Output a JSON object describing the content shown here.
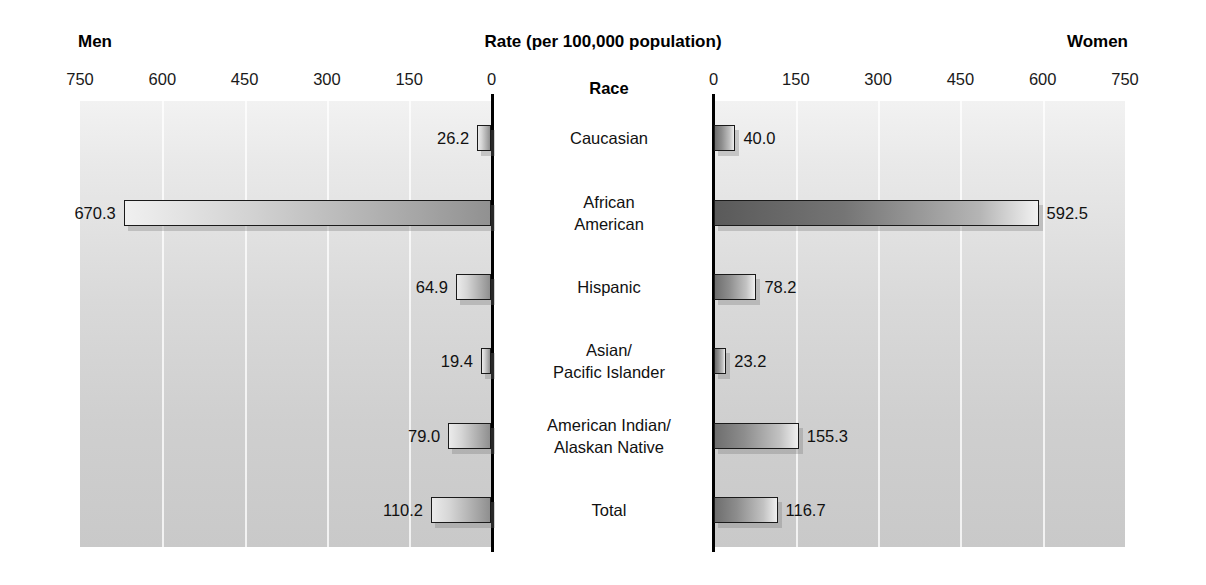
{
  "headers": {
    "men": "Men",
    "rate": "Rate (per 100,000 population)",
    "women": "Women",
    "race": "Race"
  },
  "axis": {
    "left_ticks": [
      "750",
      "600",
      "450",
      "300",
      "150",
      "0"
    ],
    "right_ticks": [
      "0",
      "150",
      "300",
      "450",
      "600",
      "750"
    ],
    "max": 750,
    "min": 0
  },
  "chart_data": {
    "type": "bar",
    "title": "Rate (per 100,000 population)",
    "subtitle": "",
    "orientation": "horizontal",
    "layout": "diverging-population-pyramid",
    "xlabel": "Rate (per 100,000 population)",
    "ylabel": "Race",
    "xlim": [
      0,
      750
    ],
    "grid": true,
    "grid_axis": "x",
    "legend": "none",
    "left_panel_label": "Men",
    "right_panel_label": "Women",
    "categories": [
      "Caucasian",
      "African American",
      "Hispanic",
      "Asian/Pacific Islander",
      "American Indian/Alaskan Native",
      "Total"
    ],
    "series": [
      {
        "name": "Men",
        "side": "left",
        "values": [
          26.2,
          670.3,
          64.9,
          19.4,
          79.0,
          110.2
        ],
        "labels": [
          "26.2",
          "670.3",
          "64.9",
          "19.4",
          "79.0",
          "110.2"
        ]
      },
      {
        "name": "Women",
        "side": "right",
        "values": [
          40.0,
          592.5,
          78.2,
          23.2,
          155.3,
          116.7
        ],
        "labels": [
          "40.0",
          "592.5",
          "78.2",
          "23.2",
          "155.3",
          "116.7"
        ]
      }
    ]
  },
  "rows": [
    {
      "label_lines": [
        "Caucasian"
      ],
      "men": "26.2",
      "women": "40.0"
    },
    {
      "label_lines": [
        "African",
        "American"
      ],
      "men": "670.3",
      "women": "592.5"
    },
    {
      "label_lines": [
        "Hispanic"
      ],
      "men": "64.9",
      "women": "78.2"
    },
    {
      "label_lines": [
        "Asian/",
        "Pacific Islander"
      ],
      "men": "19.4",
      "women": "23.2"
    },
    {
      "label_lines": [
        "American Indian/",
        "Alaskan Native"
      ],
      "men": "79.0",
      "women": "155.3"
    },
    {
      "label_lines": [
        "Total"
      ],
      "men": "110.2",
      "women": "116.7"
    }
  ],
  "colors": {
    "panel_top": "#f2f2f2",
    "panel_bottom": "#c9c9c9",
    "axis": "#000000",
    "bar_outline": "#1a1a1a",
    "text": "#111111"
  }
}
